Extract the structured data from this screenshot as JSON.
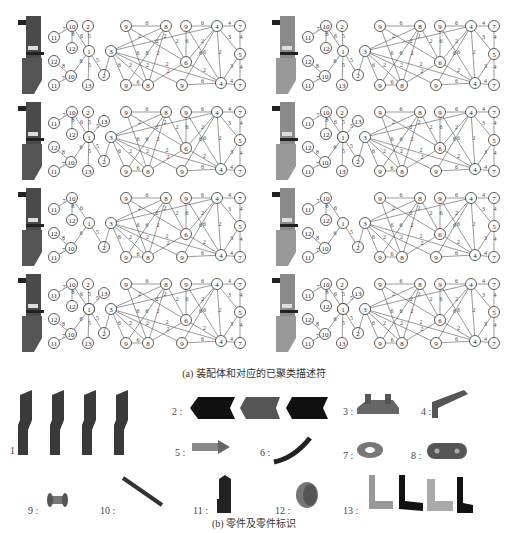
{
  "figure": {
    "caption_a": "(a) 装配体和对应的已聚类描述符",
    "caption_b": "(b) 零件及零件标识"
  },
  "panels": [
    {
      "id": "r1c1",
      "left_variant": "full",
      "has_13_top": false,
      "assembly_style": "dark"
    },
    {
      "id": "r1c2",
      "left_variant": "full",
      "has_13_top": false,
      "assembly_style": "grey"
    },
    {
      "id": "r2c1",
      "left_variant": "full",
      "has_13_top": true,
      "assembly_style": "dark"
    },
    {
      "id": "r2c2",
      "left_variant": "full",
      "has_13_top": true,
      "assembly_style": "grey"
    },
    {
      "id": "r3c1",
      "left_variant": "reduced",
      "has_13_top": false,
      "assembly_style": "dark"
    },
    {
      "id": "r3c2",
      "left_variant": "reduced",
      "has_13_top": false,
      "assembly_style": "grey"
    },
    {
      "id": "r4c1",
      "left_variant": "full",
      "has_13_top": true,
      "assembly_style": "dark"
    },
    {
      "id": "r4c2",
      "left_variant": "full",
      "has_13_top": true,
      "assembly_style": "grey"
    }
  ],
  "graph": {
    "left_nodes": [
      {
        "label": "10",
        "x": 72,
        "y": 24
      },
      {
        "label": "2",
        "x": 88,
        "y": 24
      },
      {
        "label": "11",
        "x": 54,
        "y": 35
      },
      {
        "label": "12",
        "x": 72,
        "y": 46
      },
      {
        "label": "1",
        "x": 89,
        "y": 49
      },
      {
        "label": "12",
        "x": 54,
        "y": 59
      },
      {
        "label": "10",
        "x": 71,
        "y": 74
      },
      {
        "label": "2",
        "x": 104,
        "y": 73
      },
      {
        "label": "11",
        "x": 54,
        "y": 83
      },
      {
        "label": "13",
        "x": 88,
        "y": 83
      }
    ],
    "left_edges": [
      {
        "a": 2,
        "b": 0,
        "w": "7"
      },
      {
        "a": 0,
        "b": 3,
        "w": "8"
      },
      {
        "a": 0,
        "b": 4,
        "w": "6"
      },
      {
        "a": 1,
        "b": 4,
        "w": "5"
      },
      {
        "a": 4,
        "b": 6,
        "w": "6"
      },
      {
        "a": 4,
        "b": 7,
        "w": "5"
      },
      {
        "a": 4,
        "b": 9,
        "w": "5"
      },
      {
        "a": 5,
        "b": 6,
        "w": "8"
      },
      {
        "a": 6,
        "b": 8,
        "w": "7"
      }
    ],
    "right_nodes": [
      {
        "label": "9",
        "x": 126,
        "y": 24
      },
      {
        "label": "8",
        "x": 166,
        "y": 24
      },
      {
        "label": "9",
        "x": 186,
        "y": 24
      },
      {
        "label": "4",
        "x": 217,
        "y": 24
      },
      {
        "label": "7",
        "x": 240,
        "y": 24
      },
      {
        "label": "3",
        "x": 111,
        "y": 49
      },
      {
        "label": "6",
        "x": 186,
        "y": 60
      },
      {
        "label": "5",
        "x": 240,
        "y": 52
      },
      {
        "label": "9",
        "x": 126,
        "y": 83
      },
      {
        "label": "8",
        "x": 148,
        "y": 83
      },
      {
        "label": "9",
        "x": 182,
        "y": 83
      },
      {
        "label": "4",
        "x": 221,
        "y": 81
      },
      {
        "label": "7",
        "x": 240,
        "y": 83
      }
    ],
    "right_edges": [
      {
        "a": 0,
        "b": 1,
        "w": "6"
      },
      {
        "a": 2,
        "b": 3,
        "w": "6"
      },
      {
        "a": 3,
        "b": 4,
        "w": "4"
      },
      {
        "a": 4,
        "b": 7,
        "w": "4"
      },
      {
        "a": 7,
        "b": 12,
        "w": "4"
      },
      {
        "a": 11,
        "b": 12,
        "w": "4"
      },
      {
        "a": 8,
        "b": 9,
        "w": "6"
      },
      {
        "a": 10,
        "b": 11,
        "w": "6"
      },
      {
        "a": 5,
        "b": 1,
        "w": "2"
      },
      {
        "a": 5,
        "b": 3,
        "w": "2"
      },
      {
        "a": 5,
        "b": 8,
        "w": "6"
      },
      {
        "a": 5,
        "b": 9,
        "w": "2"
      },
      {
        "a": 5,
        "b": 11,
        "w": "2"
      },
      {
        "a": 5,
        "b": 10,
        "w": "2"
      },
      {
        "a": 0,
        "b": 6,
        "w": "2"
      },
      {
        "a": 0,
        "b": 9,
        "w": "6"
      },
      {
        "a": 1,
        "b": 6,
        "w": "2"
      },
      {
        "a": 1,
        "b": 8,
        "w": "6"
      },
      {
        "a": 1,
        "b": 9,
        "w": "2"
      },
      {
        "a": 2,
        "b": 6,
        "w": "6"
      },
      {
        "a": 2,
        "b": 11,
        "w": "6"
      },
      {
        "a": 3,
        "b": 6,
        "w": "2"
      },
      {
        "a": 3,
        "b": 10,
        "w": "6"
      },
      {
        "a": 3,
        "b": 11,
        "w": "2"
      },
      {
        "a": 3,
        "b": 7,
        "w": "3"
      },
      {
        "a": 7,
        "b": 11,
        "w": "3"
      },
      {
        "a": 6,
        "b": 9,
        "w": "2"
      },
      {
        "a": 6,
        "b": 11,
        "w": "2"
      }
    ]
  },
  "parts": [
    {
      "id": "1",
      "label": "1 :",
      "x": 10,
      "y": 390,
      "lx": 10,
      "ly": 445
    },
    {
      "id": "2",
      "label": "2 :",
      "x": 190,
      "y": 395,
      "lx": 172,
      "ly": 406
    },
    {
      "id": "3",
      "label": "3 :",
      "x": 355,
      "y": 392,
      "lx": 343,
      "ly": 406
    },
    {
      "id": "4",
      "label": "4 :",
      "x": 430,
      "y": 390,
      "lx": 421,
      "ly": 406
    },
    {
      "id": "5",
      "label": "5 :",
      "x": 190,
      "y": 438,
      "lx": 175,
      "ly": 447
    },
    {
      "id": "6",
      "label": "6 :",
      "x": 270,
      "y": 436,
      "lx": 260,
      "ly": 447
    },
    {
      "id": "7",
      "label": "7 :",
      "x": 355,
      "y": 440,
      "lx": 343,
      "ly": 450
    },
    {
      "id": "8",
      "label": "8 :",
      "x": 425,
      "y": 440,
      "lx": 411,
      "ly": 450
    },
    {
      "id": "9",
      "label": "9 :",
      "x": 45,
      "y": 490,
      "lx": 28,
      "ly": 505
    },
    {
      "id": "10",
      "label": "10 :",
      "x": 120,
      "y": 475,
      "lx": 100,
      "ly": 505
    },
    {
      "id": "11",
      "label": "11 :",
      "x": 215,
      "y": 475,
      "lx": 193,
      "ly": 505
    },
    {
      "id": "12",
      "label": "12 :",
      "x": 295,
      "y": 480,
      "lx": 275,
      "ly": 505
    },
    {
      "id": "13",
      "label": "13 :",
      "x": 365,
      "y": 473,
      "lx": 343,
      "ly": 505
    }
  ]
}
